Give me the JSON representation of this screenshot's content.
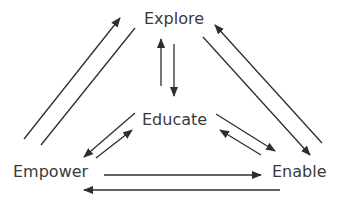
{
  "diagram": {
    "nodes": {
      "explore": "Explore",
      "educate": "Educate",
      "empower": "Empower",
      "enable": "Enable"
    },
    "edges": [
      {
        "from": "Empower",
        "to": "Explore"
      },
      {
        "from": "Explore",
        "to": "Empower"
      },
      {
        "from": "Educate",
        "to": "Explore"
      },
      {
        "from": "Explore",
        "to": "Educate"
      },
      {
        "from": "Explore",
        "to": "Enable"
      },
      {
        "from": "Enable",
        "to": "Explore"
      },
      {
        "from": "Educate",
        "to": "Empower"
      },
      {
        "from": "Empower",
        "to": "Educate"
      },
      {
        "from": "Educate",
        "to": "Enable"
      },
      {
        "from": "Enable",
        "to": "Educate"
      },
      {
        "from": "Empower",
        "to": "Enable"
      },
      {
        "from": "Enable",
        "to": "Empower"
      }
    ],
    "colors": {
      "line": "#2e2e2e",
      "text": "#3a3a3a",
      "background": "#ffffff"
    }
  }
}
